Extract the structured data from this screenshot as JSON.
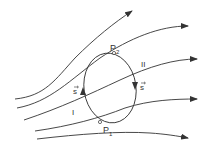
{
  "diagram": {
    "type": "streamlines-through-closed-curve",
    "labels": {
      "p2": "P",
      "p2_sub": "2",
      "p1": "P",
      "p1_sub": "1",
      "region_1": "I",
      "region_2": "II",
      "s_left": "s",
      "s_right": "s"
    },
    "streamlines": [
      {
        "name": "streamline-1",
        "path": "M15,99 C45,96 55,80 75,58 C95,38 115,22 132,11"
      },
      {
        "name": "streamline-2",
        "path": "M17,108 C50,102 70,80 100,58 C130,38 160,26 188,26"
      },
      {
        "name": "streamline-3",
        "path": "M24,120 C60,108 90,94 120,80 C150,66 175,59 197,59"
      },
      {
        "name": "streamline-4",
        "path": "M35,131 C70,126 100,118 125,108 C150,100 175,99 197,99"
      },
      {
        "name": "streamline-5",
        "path": "M37,139 C80,134 120,131 150,133 C165,134 178,136 188,138"
      }
    ],
    "colors": {
      "stroke": "#333333",
      "background": "#ffffff"
    }
  }
}
